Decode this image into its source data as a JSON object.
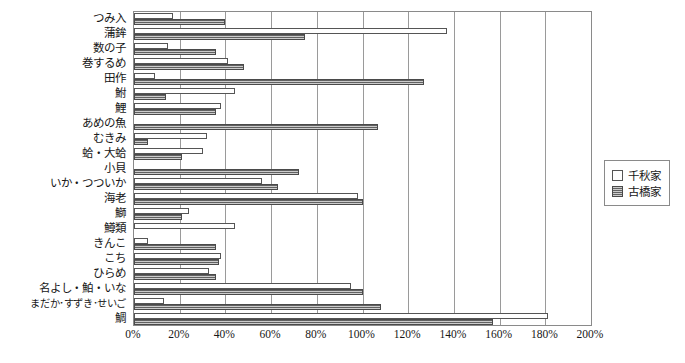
{
  "chart_data": {
    "type": "bar",
    "orientation": "horizontal",
    "title": "",
    "subtitle": "",
    "xlabel": "",
    "ylabel": "",
    "xlim": [
      0,
      200
    ],
    "xtick_labels": [
      "0%",
      "20%",
      "40%",
      "60%",
      "80%",
      "100%",
      "120%",
      "140%",
      "160%",
      "180%",
      "200%"
    ],
    "xtick_values": [
      0,
      20,
      40,
      60,
      80,
      100,
      120,
      140,
      160,
      180,
      200
    ],
    "xtick_suffix": "%",
    "grid": true,
    "grid_axis": "x",
    "legend_position": "right",
    "categories": [
      "つみ入",
      "蒲鉾",
      "数の子",
      "巻するめ",
      "田作",
      "鮒",
      "鯉",
      "あめの魚",
      "むきみ",
      "蛤・大蛤",
      "小貝",
      "いか・つついか",
      "海老",
      "鰤",
      "鱒類",
      "きんこ",
      "こち",
      "ひらめ",
      "名よし・鮊・いな",
      "まだか･すずき･せいご",
      "鯛"
    ],
    "series": [
      {
        "name": "千秋家",
        "style": "hollow-white",
        "values": [
          17,
          137,
          15,
          41,
          9,
          44,
          38,
          0,
          32,
          30,
          0,
          56,
          98,
          24,
          44,
          6,
          38,
          33,
          95,
          13,
          181
        ]
      },
      {
        "name": "古橋家",
        "style": "gray-hatched",
        "values": [
          40,
          75,
          36,
          48,
          127,
          14,
          36,
          107,
          6,
          21,
          72,
          63,
          100,
          21,
          0,
          36,
          37,
          36,
          100,
          108,
          157
        ]
      }
    ]
  },
  "legend": {
    "items": [
      {
        "label": "千秋家",
        "style": "white"
      },
      {
        "label": "古橋家",
        "style": "hatch"
      }
    ]
  }
}
